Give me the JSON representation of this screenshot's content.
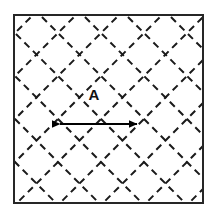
{
  "figure": {
    "type": "technical-diagram",
    "background_color": "#ffffff",
    "canvas": {
      "width": 214,
      "height": 215
    }
  },
  "boundary": {
    "shape": "square",
    "stroke_color": "#262626",
    "stroke_width": 2,
    "fill": "#ffffff",
    "x": 14,
    "y": 15,
    "width": 189,
    "height": 188
  },
  "lattice": {
    "description": "Dashed lines at +45 and -45 degrees forming a diamond grid",
    "stroke_color": "#1a1a1a",
    "stroke_width": 2,
    "dash_pattern": "7 5",
    "axis_spacing": 43,
    "angles_deg": [
      45,
      -45
    ],
    "top_vertices_x": [
      45,
      88,
      131,
      174
    ],
    "left_vertices_y": [
      45,
      88,
      131,
      174
    ],
    "right_vertices_y": [
      45,
      88,
      131,
      174
    ],
    "bottom_vertices_x": [
      66,
      110,
      153,
      196
    ]
  },
  "dimension": {
    "label": "A",
    "label_x": 94,
    "label_y": 100,
    "arrow_color": "#000000",
    "arrow_y": 124,
    "arrow_x_start": 57,
    "arrow_x_end": 140,
    "arrow_length_px": 83,
    "meaning": "horizontal spacing between adjacent lattice nodes",
    "double_headed": true
  }
}
